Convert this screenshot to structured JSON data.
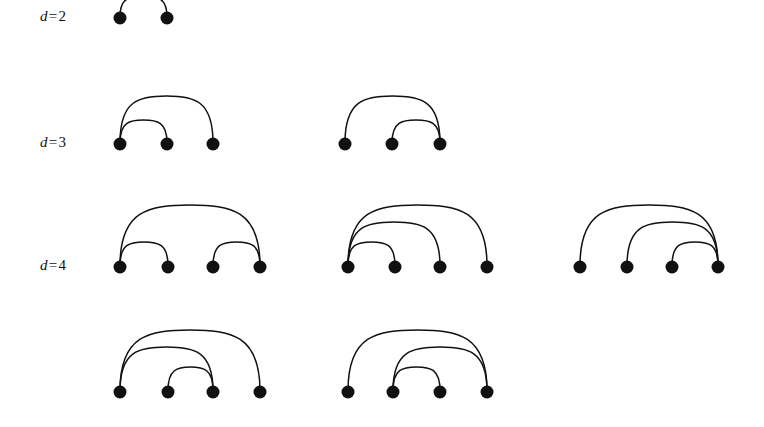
{
  "figure": {
    "background_color": "#ffffff",
    "ink_color": "#111111",
    "node_radius": 6.5,
    "arc_stroke_width": 1.5
  },
  "rows": [
    {
      "id": "row-d2",
      "label": {
        "variable": "d",
        "relation": "=",
        "value": "2",
        "text": "d=2"
      },
      "label_x": 40,
      "label_y": 18,
      "baseline_y": 18,
      "diagrams": [
        {
          "id": "d2-diagram-1",
          "nodes_x": [
            120,
            167
          ],
          "node_count": 2,
          "arcs": [
            {
              "from": 0,
              "to": 1,
              "height": 22
            }
          ]
        }
      ]
    },
    {
      "id": "row-d3",
      "label": {
        "variable": "d",
        "relation": "=",
        "value": "3",
        "text": "d=3"
      },
      "label_x": 40,
      "label_y": 144,
      "baseline_y": 144,
      "diagrams": [
        {
          "id": "d3-diagram-1",
          "nodes_x": [
            120,
            167,
            213
          ],
          "node_count": 3,
          "arcs": [
            {
              "from": 0,
              "to": 1,
              "height": 24
            },
            {
              "from": 0,
              "to": 2,
              "height": 48
            }
          ]
        },
        {
          "id": "d3-diagram-2",
          "nodes_x": [
            345,
            392,
            440
          ],
          "node_count": 3,
          "arcs": [
            {
              "from": 1,
              "to": 2,
              "height": 24
            },
            {
              "from": 0,
              "to": 2,
              "height": 48
            }
          ]
        }
      ]
    },
    {
      "id": "row-d4",
      "label": {
        "variable": "d",
        "relation": "=",
        "value": "4",
        "text": "d=4"
      },
      "label_x": 40,
      "label_y": 267,
      "baseline_y": 267,
      "diagrams": [
        {
          "id": "d4-diagram-1",
          "nodes_x": [
            120,
            168,
            213,
            260
          ],
          "node_count": 4,
          "arcs": [
            {
              "from": 0,
              "to": 1,
              "height": 25
            },
            {
              "from": 2,
              "to": 3,
              "height": 25
            },
            {
              "from": 0,
              "to": 3,
              "height": 62
            }
          ]
        },
        {
          "id": "d4-diagram-2",
          "nodes_x": [
            348,
            395,
            440,
            487
          ],
          "node_count": 4,
          "arcs": [
            {
              "from": 0,
              "to": 1,
              "height": 25
            },
            {
              "from": 0,
              "to": 2,
              "height": 45
            },
            {
              "from": 0,
              "to": 3,
              "height": 62
            }
          ]
        },
        {
          "id": "d4-diagram-3",
          "nodes_x": [
            580,
            627,
            672,
            718
          ],
          "node_count": 4,
          "arcs": [
            {
              "from": 2,
              "to": 3,
              "height": 25
            },
            {
              "from": 1,
              "to": 3,
              "height": 45
            },
            {
              "from": 0,
              "to": 3,
              "height": 62
            }
          ]
        }
      ]
    },
    {
      "id": "row-d4-continued",
      "label": {
        "variable": "",
        "relation": "",
        "value": "",
        "text": ""
      },
      "label_x": 40,
      "label_y": 392,
      "baseline_y": 392,
      "diagrams": [
        {
          "id": "d4-diagram-4",
          "nodes_x": [
            120,
            168,
            213,
            260
          ],
          "node_count": 4,
          "arcs": [
            {
              "from": 1,
              "to": 2,
              "height": 25
            },
            {
              "from": 0,
              "to": 2,
              "height": 45
            },
            {
              "from": 0,
              "to": 3,
              "height": 62
            }
          ]
        },
        {
          "id": "d4-diagram-5",
          "nodes_x": [
            348,
            393,
            440,
            487
          ],
          "node_count": 4,
          "arcs": [
            {
              "from": 1,
              "to": 2,
              "height": 25
            },
            {
              "from": 1,
              "to": 3,
              "height": 45
            },
            {
              "from": 0,
              "to": 3,
              "height": 62
            }
          ]
        }
      ]
    }
  ]
}
